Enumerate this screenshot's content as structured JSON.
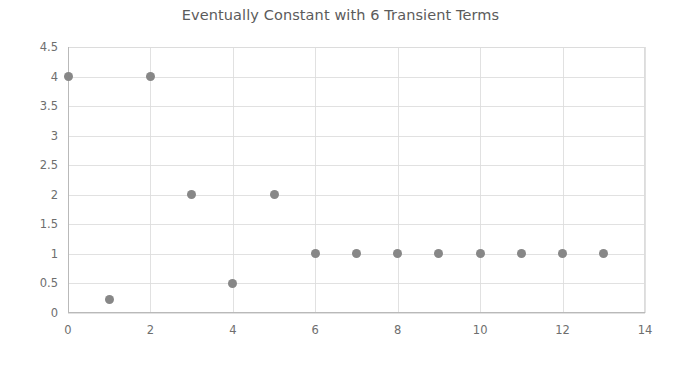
{
  "chart_data": {
    "type": "scatter",
    "title": "Eventually Constant with 6 Transient Terms",
    "xlabel": "",
    "ylabel": "",
    "xlim": [
      0,
      14
    ],
    "ylim": [
      0,
      4.5
    ],
    "grid": true,
    "legend": null,
    "marker_color": "#878787",
    "marker_shape": "circle",
    "x_ticks": [
      0,
      2,
      4,
      6,
      8,
      10,
      12,
      14
    ],
    "x_tick_labels": [
      "0",
      "2",
      "4",
      "6",
      "8",
      "10",
      "12",
      "14"
    ],
    "y_ticks": [
      0,
      0.5,
      1,
      1.5,
      2,
      2.5,
      3,
      3.5,
      4,
      4.5
    ],
    "y_tick_labels": [
      "0",
      "0.5",
      "1",
      "1.5",
      "2",
      "2.5",
      "3",
      "3.5",
      "4",
      "4.5"
    ],
    "x_gridlines": [
      0,
      2,
      4,
      6,
      8,
      10,
      12,
      14
    ],
    "y_gridlines": [
      0,
      0.5,
      1,
      1.5,
      2,
      2.5,
      3,
      3.5,
      4,
      4.5
    ],
    "x": [
      0,
      1,
      2,
      3,
      4,
      5,
      6,
      7,
      8,
      9,
      10,
      11,
      12,
      13
    ],
    "y": [
      4,
      0.22,
      4,
      2,
      0.5,
      2,
      1,
      1,
      1,
      1,
      1,
      1,
      1,
      1
    ],
    "points": [
      {
        "x": 0,
        "y": 4
      },
      {
        "x": 1,
        "y": 0.22
      },
      {
        "x": 2,
        "y": 4
      },
      {
        "x": 3,
        "y": 2
      },
      {
        "x": 4,
        "y": 0.5
      },
      {
        "x": 5,
        "y": 2
      },
      {
        "x": 6,
        "y": 1
      },
      {
        "x": 7,
        "y": 1
      },
      {
        "x": 8,
        "y": 1
      },
      {
        "x": 9,
        "y": 1
      },
      {
        "x": 10,
        "y": 1
      },
      {
        "x": 11,
        "y": 1
      },
      {
        "x": 12,
        "y": 1
      },
      {
        "x": 13,
        "y": 1
      }
    ]
  },
  "colors": {
    "background": "#ffffff",
    "marker": "#878787",
    "gridline": "#dcdcdc",
    "axis": "#b9b9b9",
    "title_text": "#5b5b5b",
    "tick_text": "#6e6e6e"
  }
}
